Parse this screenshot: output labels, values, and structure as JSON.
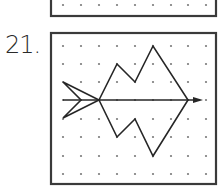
{
  "problems": [
    {
      "id": "prev",
      "visible_number": null,
      "box": {
        "x": 51,
        "y": -60,
        "width": 165,
        "height": 76
      },
      "dot_rows_y": [
        5
      ],
      "dot_cols_x": [
        63,
        81,
        99,
        117,
        135,
        153,
        171,
        188,
        206
      ]
    },
    {
      "id": "p21",
      "number_label": "21.",
      "box": {
        "x": 51,
        "y": 33,
        "width": 165,
        "height": 151
      },
      "dot_rows_y": [
        46,
        64,
        82,
        100,
        119,
        137,
        156,
        174
      ],
      "dot_cols_x": [
        63,
        81,
        99,
        117,
        135,
        153,
        171,
        188,
        206
      ],
      "axis_of_symmetry": {
        "x1": 63,
        "y1": 100,
        "x2": 196,
        "y2": 100,
        "arrowhead_tip_x": 203
      },
      "shape_outline": "99,100 117,64 135,82 153,46 188,100 153,156 135,119 117,137 99,100",
      "arrow_tail": "63,82 99,100 63,118 81,100 63,82"
    }
  ],
  "colors": {
    "ink": "#262626",
    "dot": "#7a7a7a",
    "border": "#3a3a3a",
    "background": "#ffffff"
  }
}
